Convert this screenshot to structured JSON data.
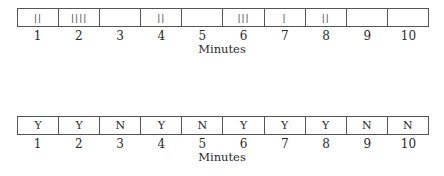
{
  "diagram1": {
    "description": "Event-recording tally per minute",
    "cells": [
      "||",
      "||||",
      "",
      "||",
      "",
      "|||",
      "|",
      "||",
      "",
      ""
    ],
    "counts": [
      2,
      4,
      0,
      2,
      0,
      3,
      1,
      2,
      0,
      0
    ],
    "minutes": [
      "1",
      "2",
      "3",
      "4",
      "5",
      "6",
      "7",
      "8",
      "9",
      "10"
    ],
    "axis_label": "Minutes"
  },
  "diagram2": {
    "description": "Interval recording (Y/N) per minute",
    "cells": [
      "Y",
      "Y",
      "N",
      "Y",
      "N",
      "Y",
      "Y",
      "Y",
      "N",
      "N"
    ],
    "minutes": [
      "1",
      "2",
      "3",
      "4",
      "5",
      "6",
      "7",
      "8",
      "9",
      "10"
    ],
    "axis_label": "Minutes"
  }
}
